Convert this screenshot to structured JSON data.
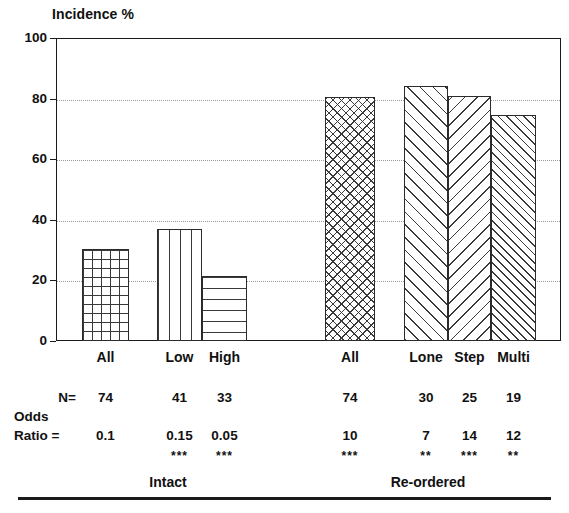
{
  "chart_data": {
    "type": "bar",
    "title": "",
    "ylabel": "Incidence %",
    "xlabel": "",
    "ylim": [
      0,
      100
    ],
    "ytick_values": [
      0,
      20,
      40,
      60,
      80,
      100
    ],
    "ytick_labels": [
      "0",
      "20",
      "40",
      "60",
      "80",
      "100"
    ],
    "grid": "horizontal dotted at 20, 40, 60, 80",
    "legend": "none",
    "categories": [
      "All",
      "Low",
      "High",
      "All",
      "Lone",
      "Step",
      "Multi"
    ],
    "values": [
      30.5,
      37,
      21.5,
      80.5,
      84,
      81,
      74.5
    ],
    "series": [
      {
        "name": "Incidence %",
        "values": [
          30.5,
          37,
          21.5,
          80.5,
          84,
          81,
          74.5
        ]
      }
    ],
    "bars": [
      {
        "group": "Intact",
        "label": "All",
        "value": 30.5,
        "pattern": "square-grid",
        "n": "74",
        "odds_ratio": "0.1",
        "significance": ""
      },
      {
        "group": "Intact",
        "label": "Low",
        "value": 37,
        "pattern": "vertical-lines",
        "n": "41",
        "odds_ratio": "0.15",
        "significance": "***"
      },
      {
        "group": "Intact",
        "label": "High",
        "value": 21.5,
        "pattern": "horizontal-lines",
        "n": "33",
        "odds_ratio": "0.05",
        "significance": "***"
      },
      {
        "group": "Re-ordered",
        "label": "All",
        "value": 80.5,
        "pattern": "diagonal-crosshatch",
        "n": "74",
        "odds_ratio": "10",
        "significance": "***"
      },
      {
        "group": "Re-ordered",
        "label": "Lone",
        "value": 84,
        "pattern": "forward-diagonal",
        "n": "30",
        "odds_ratio": "7",
        "significance": "**"
      },
      {
        "group": "Re-ordered",
        "label": "Step",
        "value": 81,
        "pattern": "backward-diagonal",
        "n": "25",
        "odds_ratio": "14",
        "significance": "***"
      },
      {
        "group": "Re-ordered",
        "label": "Multi",
        "value": 74.5,
        "pattern": "dense-forward-diagonal",
        "n": "19",
        "odds_ratio": "12",
        "significance": "**"
      }
    ],
    "row_labels": {
      "n": "N=",
      "odds_line1": "Odds",
      "odds_line2": "Ratio ="
    },
    "group_labels": [
      "Intact",
      "Re-ordered"
    ],
    "colors": {
      "axis": "#1a1a1a",
      "grid": "#9a9a9a",
      "bar_outline": "#2b2b2b",
      "bar_fill": "#ffffff",
      "hatch": "#3a3a3a",
      "text": "#111111",
      "background": "#ffffff"
    }
  }
}
